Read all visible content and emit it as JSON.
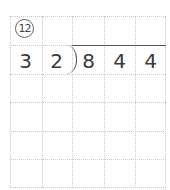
{
  "problem": {
    "number_label": "12",
    "divisor": [
      "3",
      "2"
    ],
    "dividend": [
      "8",
      "4",
      "4"
    ]
  },
  "grid": {
    "columns": 5,
    "rows": 6,
    "line_color": "#c8c8c8",
    "digit_color": "#3a3a3a"
  }
}
